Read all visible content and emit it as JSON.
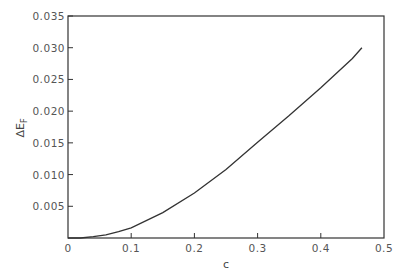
{
  "chart_data": {
    "type": "line",
    "title": "",
    "xlabel": "c",
    "ylabel": "ΔE_F",
    "xlim": [
      0,
      0.5
    ],
    "ylim": [
      0,
      0.035
    ],
    "grid": false,
    "legend": null,
    "x_ticks": [
      "0",
      "0.1",
      "0.2",
      "0.3",
      "0.4",
      "0.5"
    ],
    "y_ticks": [
      "0.005",
      "0.010",
      "0.015",
      "0.020",
      "0.025",
      "0.030",
      "0.035"
    ],
    "series": [
      {
        "name": "ΔE_F",
        "x": [
          0.0,
          0.02,
          0.04,
          0.06,
          0.08,
          0.1,
          0.15,
          0.2,
          0.25,
          0.3,
          0.35,
          0.4,
          0.45,
          0.465
        ],
        "y": [
          0.0,
          0.0,
          0.0002,
          0.0005,
          0.001,
          0.0016,
          0.004,
          0.0071,
          0.0108,
          0.0151,
          0.0193,
          0.0237,
          0.0283,
          0.03
        ]
      }
    ]
  },
  "labels": {
    "xlabel": "c",
    "ylabel_main": "ΔE",
    "ylabel_sub": "F",
    "x_ticks": [
      "0",
      "0.1",
      "0.2",
      "0.3",
      "0.4",
      "0.5"
    ],
    "y_ticks": [
      "0.005",
      "0.010",
      "0.015",
      "0.020",
      "0.025",
      "0.030",
      "0.035"
    ]
  }
}
